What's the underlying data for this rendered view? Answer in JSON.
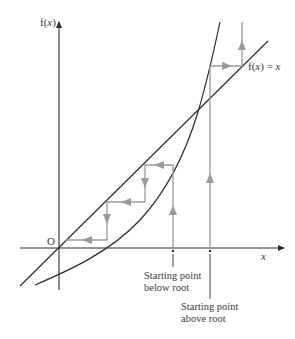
{
  "figure": {
    "type": "cobweb-iteration-diagram",
    "y_axis_label_prefix": "f(",
    "y_axis_label_var": "x",
    "y_axis_label_suffix": ")",
    "x_axis_label": "x",
    "origin_label": "O",
    "line_label_prefix": "f(",
    "line_label_var": "x",
    "line_label_suffix": ") = ",
    "line_label_rhs": "x",
    "start_below": {
      "line1": "Starting point",
      "line2": "below root"
    },
    "start_above": {
      "line1": "Starting point",
      "line2": "above root"
    }
  },
  "colors": {
    "axis": "#2b2b2b",
    "curve": "#2b2b2b",
    "line": "#2b2b2b",
    "cobweb": "#9a9a9a",
    "text": "#3a3a3a"
  }
}
